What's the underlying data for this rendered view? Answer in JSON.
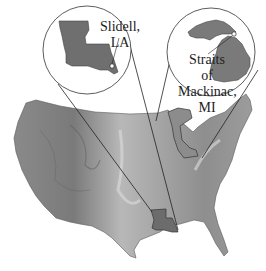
{
  "figure": {
    "type": "locator-map",
    "base_map": "contiguous-united-states-relief",
    "colors": {
      "background": "#ffffff",
      "map_light": "#c8c8c8",
      "map_mid": "#9a9a9a",
      "map_dark": "#6e6e6e",
      "inset_state": "#6f6f6f",
      "lines": "#222222"
    },
    "insets": [
      {
        "id": "louisiana",
        "state": "Louisiana",
        "label_line1": "Slidell,",
        "label_line2": "LA"
      },
      {
        "id": "michigan",
        "state": "Michigan",
        "label_line1": "Straits",
        "label_line2": "of",
        "label_line3": "Mackinac,",
        "label_line4": "MI"
      }
    ]
  }
}
